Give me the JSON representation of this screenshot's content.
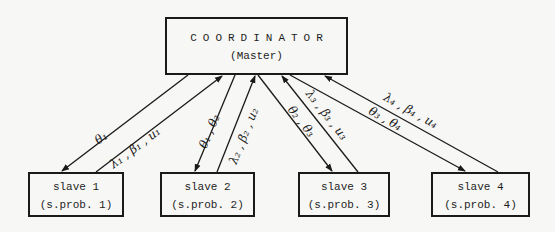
{
  "coordinator": {
    "title": "COORDINATOR",
    "subtitle": "(Master)"
  },
  "slaves": [
    {
      "name": "slave 1",
      "subproblem": "(s.prob. 1)"
    },
    {
      "name": "slave 2",
      "subproblem": "(s.prob. 2)"
    },
    {
      "name": "slave 3",
      "subproblem": "(s.prob. 3)"
    },
    {
      "name": "slave 4",
      "subproblem": "(s.prob. 4)"
    }
  ],
  "edges": [
    {
      "to_slave": "1",
      "down_label": "θ₁",
      "up_label": "λ₁ , β₁ , u₁"
    },
    {
      "to_slave": "2",
      "down_label": "θ₁ , θ₂",
      "up_label": "λ₂ , β₂ , u₂"
    },
    {
      "to_slave": "3",
      "down_label": "θ₂ , θ₃",
      "up_label": "λ₃ , β₃ , u₃"
    },
    {
      "to_slave": "4",
      "down_label": "θ₃ , θ₄",
      "up_label": "λ₄ , β₄ , u₄"
    }
  ],
  "colors": {
    "line": "#1a1a1a",
    "background": "#f7f7f5"
  }
}
